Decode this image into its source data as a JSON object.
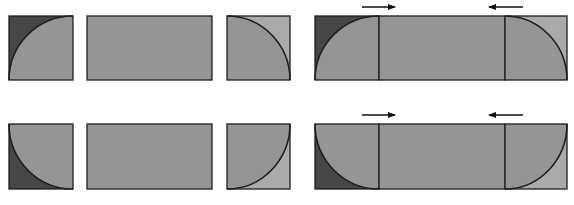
{
  "diagram": {
    "colors": {
      "background": "#ffffff",
      "fill": "#959595",
      "dark_corner": "#464646",
      "light_corner": "#aaaaaa",
      "stroke": "#1e1e1e",
      "arrow": "#111111"
    },
    "rows": [
      {
        "name": "top-row",
        "y": 16,
        "h": 64,
        "parts": {
          "left_piece": {
            "x": 9,
            "w": 64,
            "corner": "top-left",
            "corner_tone": "dark"
          },
          "center_piece": {
            "x": 87,
            "w": 125
          },
          "right_piece": {
            "x": 227,
            "w": 63,
            "corner": "top-right",
            "corner_tone": "light"
          }
        },
        "assembled": {
          "x": 315,
          "w": 252,
          "dividers": [
            379,
            505
          ],
          "arrows": [
            {
              "direction": "right",
              "x1": 362,
              "x2": 395,
              "y": 7
            },
            {
              "direction": "left",
              "x1": 523,
              "x2": 489,
              "y": 7
            }
          ]
        }
      },
      {
        "name": "bottom-row",
        "y": 124,
        "h": 65,
        "parts": {
          "left_piece": {
            "x": 9,
            "w": 64,
            "corner": "bottom-left",
            "corner_tone": "dark"
          },
          "center_piece": {
            "x": 87,
            "w": 125
          },
          "right_piece": {
            "x": 227,
            "w": 63,
            "corner": "bottom-right",
            "corner_tone": "light"
          }
        },
        "assembled": {
          "x": 315,
          "w": 252,
          "dividers": [
            379,
            505
          ],
          "arrows": [
            {
              "direction": "right",
              "x1": 362,
              "x2": 395,
              "y": 115
            },
            {
              "direction": "left",
              "x1": 523,
              "x2": 489,
              "y": 115
            }
          ]
        }
      }
    ]
  }
}
